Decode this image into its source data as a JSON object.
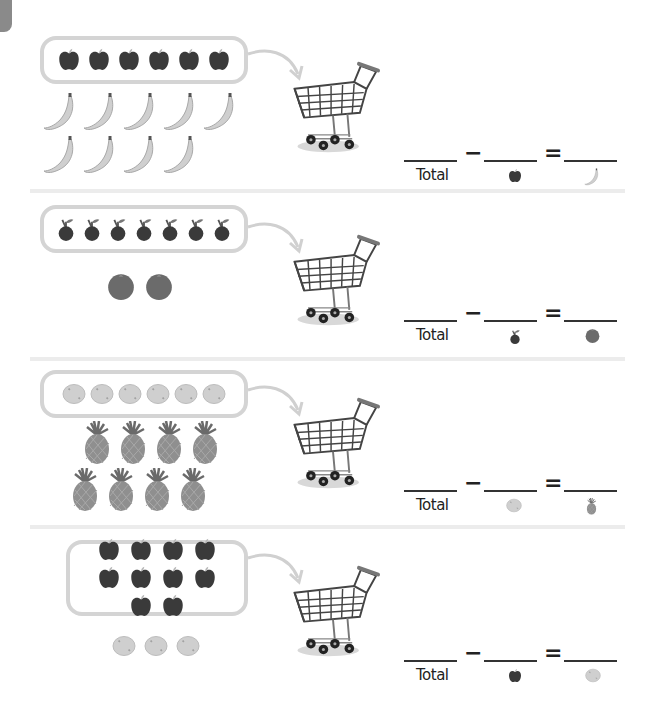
{
  "worksheet": {
    "accent_colors": {
      "tab": "#8a8a8a",
      "box_border": "#d4d4d4",
      "divider": "#ececec",
      "ink": "#222222"
    },
    "problems": [
      {
        "id": 1,
        "boxed_item": "apple",
        "boxed_count": 6,
        "loose_item": "banana",
        "loose_count": 9,
        "equation": {
          "minus": "−",
          "equals": "=",
          "total_label": "Total",
          "subtrahend_icon": "apple-icon",
          "result_icon": "banana-icon"
        }
      },
      {
        "id": 2,
        "boxed_item": "cherry",
        "boxed_count": 7,
        "loose_item": "orange",
        "loose_count": 2,
        "equation": {
          "minus": "−",
          "equals": "=",
          "total_label": "Total",
          "subtrahend_icon": "cherry-icon",
          "result_icon": "orange-icon"
        }
      },
      {
        "id": 3,
        "boxed_item": "lemon",
        "boxed_count": 6,
        "loose_item": "pineapple",
        "loose_count": 8,
        "equation": {
          "minus": "−",
          "equals": "=",
          "total_label": "Total",
          "subtrahend_icon": "lemon-icon",
          "result_icon": "pineapple-icon"
        }
      },
      {
        "id": 4,
        "boxed_item": "apple",
        "boxed_count": 10,
        "loose_item": "lemon",
        "loose_count": 3,
        "equation": {
          "minus": "−",
          "equals": "=",
          "total_label": "Total",
          "subtrahend_icon": "apple-icon",
          "result_icon": "lemon-icon"
        }
      }
    ]
  }
}
